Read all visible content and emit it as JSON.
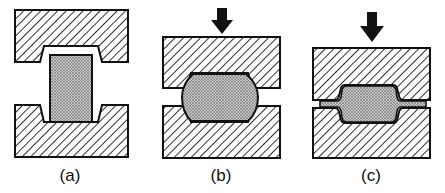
{
  "figure": {
    "panels": [
      {
        "id": "a",
        "label": "(a)",
        "label_x": 70,
        "description": "Blank placed between open dies",
        "has_arrow": false
      },
      {
        "id": "b",
        "label": "(b)",
        "label_x": 221,
        "description": "Partial closing of dies, workpiece bulges",
        "has_arrow": true
      },
      {
        "id": "c",
        "label": "(c)",
        "label_x": 371,
        "description": "Dies closed with flash formed",
        "has_arrow": true
      }
    ]
  },
  "colors": {
    "outline": "#111111",
    "hatch": "#1a1a1a",
    "workpiece": "#9a9a9a",
    "background": "#ffffff"
  }
}
